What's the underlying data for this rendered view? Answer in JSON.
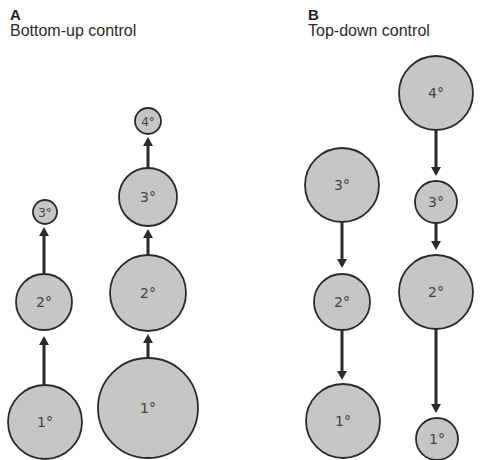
{
  "panels": [
    {
      "letter": "A",
      "title": "Bottom-up control",
      "columns": [
        {
          "nodes": [
            {
              "label": "1°",
              "cx": 45,
              "cy": 422,
              "r": 37
            },
            {
              "label": "2°",
              "cx": 44,
              "cy": 302,
              "r": 28
            },
            {
              "label": "3°",
              "cx": 45,
              "cy": 212,
              "r": 12
            }
          ],
          "arrows": [
            {
              "x": 44,
              "from": 385,
              "to": 336
            },
            {
              "x": 44,
              "from": 273,
              "to": 227
            }
          ]
        },
        {
          "nodes": [
            {
              "label": "1°",
              "cx": 148,
              "cy": 408,
              "r": 50
            },
            {
              "label": "2°",
              "cx": 148,
              "cy": 293,
              "r": 38
            },
            {
              "label": "3°",
              "cx": 148,
              "cy": 197,
              "r": 29
            },
            {
              "label": "4°",
              "cx": 148,
              "cy": 121,
              "r": 13
            }
          ],
          "arrows": [
            {
              "x": 148,
              "from": 358,
              "to": 334
            },
            {
              "x": 148,
              "from": 255,
              "to": 229
            },
            {
              "x": 148,
              "from": 168,
              "to": 137
            }
          ]
        }
      ]
    },
    {
      "letter": "B",
      "title": "Top-down control",
      "columns": [
        {
          "nodes": [
            {
              "label": "3°",
              "cx": 342,
              "cy": 185,
              "r": 37
            },
            {
              "label": "2°",
              "cx": 342,
              "cy": 302,
              "r": 28
            },
            {
              "label": "1°",
              "cx": 343,
              "cy": 421,
              "r": 37
            }
          ],
          "arrows": [
            {
              "x": 342,
              "from": 222,
              "to": 268
            },
            {
              "x": 342,
              "from": 331,
              "to": 380
            }
          ]
        },
        {
          "nodes": [
            {
              "label": "4°",
              "cx": 436,
              "cy": 93,
              "r": 37
            },
            {
              "label": "3°",
              "cx": 436,
              "cy": 202,
              "r": 21
            },
            {
              "label": "2°",
              "cx": 436,
              "cy": 292,
              "r": 37
            },
            {
              "label": "1°",
              "cx": 437,
              "cy": 439,
              "r": 21
            }
          ],
          "arrows": [
            {
              "x": 436,
              "from": 130,
              "to": 176
            },
            {
              "x": 436,
              "from": 223,
              "to": 250
            },
            {
              "x": 436,
              "from": 329,
              "to": 413
            }
          ]
        }
      ]
    }
  ],
  "colors": {
    "node_fill": "#c6c6c6",
    "node_stroke": "#2b2b2b",
    "arrow": "#2b2b2b"
  }
}
